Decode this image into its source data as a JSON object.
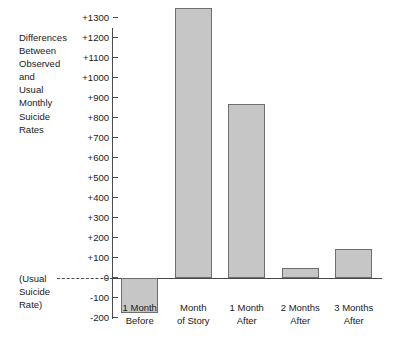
{
  "chart_data": {
    "type": "bar",
    "title": "",
    "ylabel": "Differences Between Observed and Usual Monthly Suicide Rates",
    "xlabel": "",
    "categories": [
      "1 Month\nBefore",
      "Month\nof Story",
      "1 Month\nAfter",
      "2 Months\nAfter",
      "3 Months\nAfter"
    ],
    "values": [
      -175,
      1350,
      870,
      50,
      145
    ],
    "ylim": [
      -200,
      1400
    ],
    "ytick_values": [
      1300,
      1200,
      1100,
      1000,
      900,
      800,
      700,
      600,
      500,
      400,
      300,
      200,
      100,
      0,
      -100,
      -200
    ],
    "ytick_labels": [
      "+1300",
      "+1200",
      "+1100",
      "+1000",
      "+900",
      "+800",
      "+700",
      "+600",
      "+500",
      "+400",
      "+300",
      "+200",
      "+100",
      "0",
      "-100",
      "-200"
    ],
    "grid": false,
    "legend": null,
    "baseline_value": 0,
    "baseline_annotation": "(Usual\nSuicide\nRate)",
    "bar_fill_color": "#c6c6c6",
    "bar_border_color": "#6e6e6e",
    "axis_color": "#4a4a4a"
  },
  "axis": {
    "y_title": "Differences\nBetween\nObserved\nand\nUsual\nMonthly\nSuicide\nRates",
    "baseline_note": "(Usual\nSuicide\nRate)"
  }
}
